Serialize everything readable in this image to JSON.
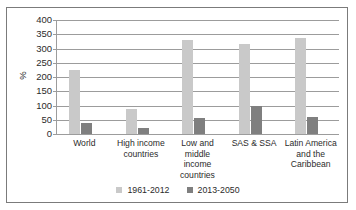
{
  "chart_data": {
    "type": "bar",
    "title": "",
    "subtitle": "",
    "xlabel": "",
    "ylabel": "%",
    "ylim": [
      0,
      400
    ],
    "yticks": [
      0,
      50,
      100,
      150,
      200,
      250,
      300,
      350,
      400
    ],
    "grid": true,
    "legend_position": "bottom",
    "categories": [
      "World",
      "High income countries",
      "Low and middle income countries",
      "SAS & SSA",
      "Latin America and the Caribbean"
    ],
    "category_lines": [
      [
        "World"
      ],
      [
        "High income",
        "countries"
      ],
      [
        "Low and middle",
        "income",
        "countries"
      ],
      [
        "SAS & SSA"
      ],
      [
        "Latin America",
        "and the",
        "Caribbean"
      ]
    ],
    "series": [
      {
        "name": "1961-2012",
        "color": "#c9c9c9",
        "values": [
          225,
          88,
          330,
          315,
          337
        ]
      },
      {
        "name": "2013-2050",
        "color": "#7f7f7f",
        "values": [
          40,
          22,
          55,
          100,
          58
        ]
      }
    ]
  },
  "figure": {
    "border_color": "#7b7b7b",
    "gridline_color": "#9c9c9c",
    "background": "#ffffff",
    "text_color": "#2b2b2b"
  }
}
